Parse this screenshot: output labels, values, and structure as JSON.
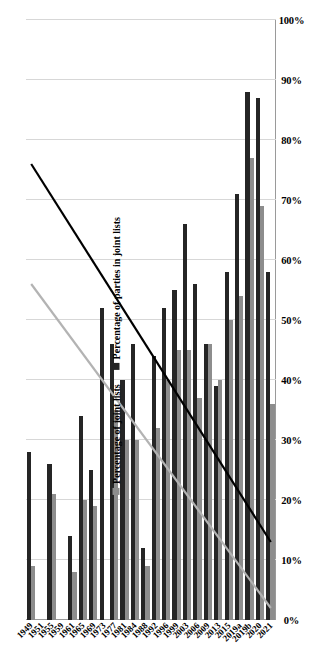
{
  "chart_data": {
    "type": "bar",
    "orientation": "horizontal",
    "title": "",
    "xlabel": "",
    "ylabel": "",
    "xlim": [
      0,
      1.0
    ],
    "grid": true,
    "legend_position": "inside-upper-left",
    "tick_labels": [
      "0%",
      "10%",
      "20%",
      "30%",
      "40%",
      "50%",
      "60%",
      "70%",
      "80%",
      "90%",
      "100%"
    ],
    "tick_values": [
      0,
      10,
      20,
      30,
      40,
      50,
      60,
      70,
      80,
      90,
      100
    ],
    "categories": [
      "1949",
      "1951",
      "1955",
      "1959",
      "1961",
      "1965",
      "1969",
      "1973",
      "1977",
      "1981",
      "1984",
      "1988",
      "1992",
      "1996",
      "1999",
      "2003",
      "2006",
      "2009",
      "2013",
      "2015",
      "2019a",
      "2019b",
      "2020",
      "2021"
    ],
    "series": [
      {
        "name": "Percentage of joint lists",
        "color": "#8d8d8d",
        "values": [
          9,
          0,
          21,
          0,
          8,
          20,
          19,
          0,
          35,
          30,
          30,
          9,
          32,
          40,
          45,
          45,
          37,
          46,
          40,
          50,
          54,
          77,
          69,
          36
        ]
      },
      {
        "name": "Percentage of parties in joint lists",
        "color": "#252525",
        "values": [
          28,
          0,
          26,
          0,
          14,
          34,
          25,
          52,
          46,
          40,
          46,
          12,
          44,
          52,
          55,
          66,
          56,
          46,
          39,
          58,
          71,
          88,
          87,
          58
        ]
      }
    ],
    "trendlines": [
      {
        "name": "trend-parties-in-joint-lists",
        "color": "#000000",
        "start_value": 13,
        "end_value": 76
      },
      {
        "name": "trend-joint-lists",
        "color": "#b3b3b3",
        "start_value": 2,
        "end_value": 56
      }
    ]
  },
  "legend": {
    "entries": [
      {
        "label": "Percentage of joint lists",
        "color": "#8d8d8d"
      },
      {
        "label": "Percentage of parties in joint lists",
        "color": "#252525"
      }
    ]
  }
}
